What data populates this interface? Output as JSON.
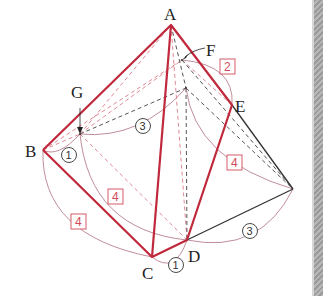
{
  "colors": {
    "solid_edge": "#c0283c",
    "dashed_red": "#e08a96",
    "dashed_gray": "#555555",
    "black_edge": "#333333",
    "arc": "#b07080",
    "box_label": "#d04a5a"
  },
  "points": {
    "A": {
      "label": "A",
      "x": 171,
      "y": 25
    },
    "B": {
      "label": "B",
      "x": 43,
      "y": 150
    },
    "C": {
      "label": "C",
      "x": 152,
      "y": 257
    },
    "D": {
      "label": "D",
      "x": 187,
      "y": 240
    },
    "E": {
      "label": "E",
      "x": 232,
      "y": 105
    },
    "F": {
      "label": "F",
      "x": 182,
      "y": 60
    },
    "G": {
      "label": "G",
      "x": 80,
      "y": 134
    }
  },
  "measurements": {
    "circled": [
      {
        "id": "bg",
        "text": "1"
      },
      {
        "id": "g-hidden",
        "text": "3"
      },
      {
        "id": "cd",
        "text": "1"
      },
      {
        "id": "d-right",
        "text": "3"
      }
    ],
    "boxed": [
      {
        "id": "fe",
        "text": "2"
      },
      {
        "id": "right-edge",
        "text": "4"
      },
      {
        "id": "g-d",
        "text": "4"
      },
      {
        "id": "b-c",
        "text": "4"
      }
    ]
  }
}
